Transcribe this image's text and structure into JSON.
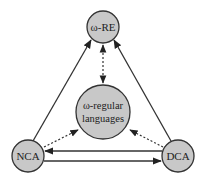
{
  "nodes": {
    "ore": {
      "label": "ω-RE",
      "cx": 103,
      "cy": 27,
      "r": 16
    },
    "center": {
      "label_line1": "ω-regular",
      "label_line2": "languages",
      "cx": 103,
      "cy": 112,
      "r": 27
    },
    "nca": {
      "label": "NCA",
      "cx": 28,
      "cy": 156,
      "r": 16
    },
    "dca": {
      "label": "DCA",
      "cx": 178,
      "cy": 156,
      "r": 16
    }
  },
  "edges": [
    {
      "from": "NCA",
      "to": "ω-RE",
      "style": "solid"
    },
    {
      "from": "DCA",
      "to": "ω-RE",
      "style": "solid"
    },
    {
      "from": "DCA",
      "to": "NCA",
      "style": "solid"
    },
    {
      "from": "NCA",
      "to": "DCA",
      "style": "solid"
    },
    {
      "from": "ω-RE",
      "to": "ω-regular languages",
      "style": "dotted",
      "bidirectional": true
    },
    {
      "from": "NCA",
      "to": "ω-regular languages",
      "style": "dotted"
    },
    {
      "from": "DCA",
      "to": "ω-regular languages",
      "style": "dotted"
    }
  ],
  "colors": {
    "node_fill": "#c8c8c8",
    "stroke": "#333333",
    "background": "#ffffff"
  }
}
